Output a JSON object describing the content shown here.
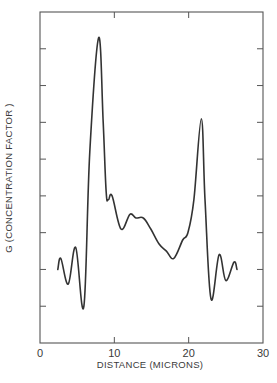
{
  "chart_data": {
    "type": "line",
    "title": "",
    "xlabel": "DISTANCE   (MICRONS)",
    "ylabel": "G    (CONCENTRATION  FACTOR )",
    "xlim": [
      0,
      30
    ],
    "ylim": [
      0,
      9
    ],
    "x_ticks": [
      0,
      10,
      20,
      30
    ],
    "x_tick_labels": [
      "0",
      "10",
      "20",
      "30"
    ],
    "y_ticks": [
      1,
      2,
      3,
      4,
      5,
      6,
      7,
      8
    ],
    "y_tick_labels": [],
    "grid": false,
    "legend": null,
    "frame": "box with inward ticks on all sides",
    "series": [
      {
        "name": "G",
        "color": "#333333",
        "x": [
          2.4,
          2.8,
          3.8,
          4.8,
          5.9,
          6.7,
          7.9,
          8.5,
          8.9,
          9.2,
          9.7,
          10.9,
          12.1,
          12.9,
          13.9,
          14.9,
          16.0,
          17.0,
          18.0,
          19.2,
          19.9,
          20.7,
          21.7,
          22.2,
          23.0,
          24.1,
          25.0,
          26.1,
          26.5
        ],
        "y": [
          2.0,
          2.3,
          1.6,
          2.6,
          1.0,
          5.2,
          8.3,
          6.0,
          4.1,
          3.9,
          4.0,
          3.1,
          3.5,
          3.4,
          3.4,
          3.1,
          2.7,
          2.5,
          2.3,
          2.8,
          3.0,
          3.9,
          6.1,
          3.9,
          1.2,
          2.4,
          1.7,
          2.2,
          2.0
        ]
      }
    ]
  },
  "plot_area": {
    "left": 40,
    "right": 263,
    "top": 12,
    "bottom": 343
  },
  "colors": {
    "ink": "#333333",
    "frame": "#555555",
    "background": "#ffffff"
  }
}
